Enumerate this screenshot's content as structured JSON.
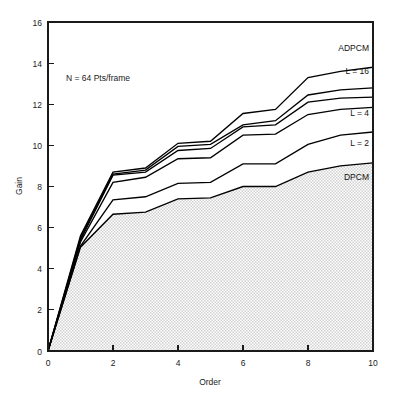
{
  "chart_data": {
    "type": "line",
    "title": "",
    "xlabel": "Order",
    "ylabel": "Gain",
    "xlim": [
      0,
      10
    ],
    "ylim": [
      0,
      16
    ],
    "xticks": [
      0,
      2,
      4,
      6,
      8,
      10
    ],
    "yticks": [
      0,
      2,
      4,
      6,
      8,
      10,
      12,
      14,
      16
    ],
    "xtick_labels": [
      "0",
      "2",
      "4",
      "6",
      "8",
      "10"
    ],
    "ytick_labels": [
      "0",
      "2",
      "4",
      "6",
      "8",
      "10",
      "12",
      "14",
      "16"
    ],
    "grid": false,
    "legend_position": "inline-right",
    "annotation": "N = 64 Pts/frame",
    "x": [
      0,
      1,
      2,
      3,
      4,
      5,
      6,
      7,
      8,
      9,
      10
    ],
    "series": [
      {
        "name": "ADPCM",
        "label": "ADPCM",
        "values": [
          0.0,
          5.6,
          8.7,
          8.9,
          10.1,
          10.2,
          11.55,
          11.75,
          13.3,
          13.6,
          13.8
        ]
      },
      {
        "name": "L = 16",
        "label": "L = 16",
        "values": [
          0.0,
          5.5,
          8.6,
          8.8,
          9.95,
          10.05,
          11.0,
          11.2,
          12.45,
          12.7,
          12.8
        ]
      },
      {
        "name": "L = 8",
        "label": "",
        "values": [
          0.0,
          5.4,
          8.55,
          8.7,
          9.75,
          9.85,
          10.9,
          11.0,
          12.1,
          12.3,
          12.35
        ]
      },
      {
        "name": "L = 4",
        "label": "L = 4",
        "values": [
          0.0,
          5.3,
          8.2,
          8.45,
          9.35,
          9.4,
          10.5,
          10.55,
          11.5,
          11.75,
          11.85
        ]
      },
      {
        "name": "L = 2",
        "label": "L = 2",
        "values": [
          0.0,
          5.1,
          7.35,
          7.5,
          8.15,
          8.2,
          9.1,
          9.1,
          10.05,
          10.5,
          10.65
        ]
      },
      {
        "name": "DPCM",
        "label": "DPCM",
        "values": [
          0.0,
          5.05,
          6.65,
          6.75,
          7.4,
          7.45,
          8.0,
          8.0,
          8.7,
          9.0,
          9.15
        ]
      }
    ],
    "shaded_series": "DPCM",
    "shade_color": "#e9e9e9",
    "line_color": "#000000"
  },
  "labels": {
    "adpcm": "ADPCM",
    "l16": "L = 16",
    "l4": "L = 4",
    "l2": "L = 2",
    "dpcm": "DPCM",
    "annotation": "N = 64 Pts/frame",
    "xlabel": "Order",
    "ylabel": "Gain"
  },
  "ytick_labels": {
    "t0": "0",
    "t2": "2",
    "t4": "4",
    "t6": "6",
    "t8": "8",
    "t10": "10",
    "t12": "12",
    "t14": "14",
    "t16": "16"
  },
  "xtick_labels": {
    "t0": "0",
    "t2": "2",
    "t4": "4",
    "t6": "6",
    "t8": "8",
    "t10": "10"
  }
}
